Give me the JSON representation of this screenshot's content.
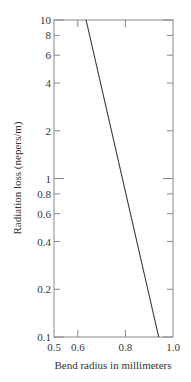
{
  "chart_data": {
    "type": "line",
    "title": "",
    "xlabel": "Bend radius in millimeters",
    "ylabel": "Radiation loss (nepers/m)",
    "xlim": [
      0.5,
      1.0
    ],
    "ylim": [
      0.1,
      10
    ],
    "yscale": "log",
    "grid": false,
    "legend": null,
    "x_ticks": [
      {
        "value": 0.5,
        "label": "0.5"
      },
      {
        "value": 0.6,
        "label": "0.6"
      },
      {
        "value": 0.8,
        "label": "0.8"
      },
      {
        "value": 1.0,
        "label": "1.0"
      }
    ],
    "y_ticks": [
      {
        "value": 10,
        "label": "10"
      },
      {
        "value": 8,
        "label": "8"
      },
      {
        "value": 6,
        "label": "6"
      },
      {
        "value": 4,
        "label": "4"
      },
      {
        "value": 2,
        "label": "2"
      },
      {
        "value": 1,
        "label": "1"
      },
      {
        "value": 0.8,
        "label": "0.8"
      },
      {
        "value": 0.6,
        "label": "0.6"
      },
      {
        "value": 0.4,
        "label": "0.4"
      },
      {
        "value": 0.2,
        "label": "0.2"
      },
      {
        "value": 0.1,
        "label": "0.1"
      }
    ],
    "series": [
      {
        "name": "Radiation loss",
        "x": [
          0.635,
          0.94
        ],
        "y": [
          10,
          0.1
        ]
      }
    ]
  },
  "colors": {
    "axis": "#888888",
    "line": "#333333",
    "text": "#333333"
  }
}
